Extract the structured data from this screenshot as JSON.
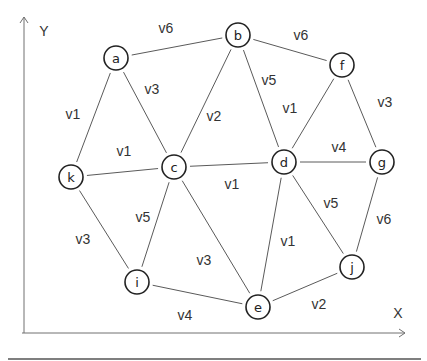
{
  "diagram": {
    "type": "weighted-undirected-graph",
    "axes": {
      "x_label": "X",
      "y_label": "Y"
    },
    "nodes": [
      {
        "id": "a",
        "label": "a",
        "x": 116,
        "y": 58
      },
      {
        "id": "b",
        "label": "b",
        "x": 238,
        "y": 35
      },
      {
        "id": "f",
        "label": "f",
        "x": 342,
        "y": 65
      },
      {
        "id": "k",
        "label": "k",
        "x": 71,
        "y": 177
      },
      {
        "id": "c",
        "label": "c",
        "x": 174,
        "y": 167
      },
      {
        "id": "d",
        "label": "d",
        "x": 284,
        "y": 162
      },
      {
        "id": "g",
        "label": "g",
        "x": 382,
        "y": 162
      },
      {
        "id": "i",
        "label": "i",
        "x": 137,
        "y": 282
      },
      {
        "id": "e",
        "label": "e",
        "x": 258,
        "y": 307
      },
      {
        "id": "j",
        "label": "j",
        "x": 352,
        "y": 267
      }
    ],
    "edges": [
      {
        "from": "a",
        "to": "b",
        "label": "v6",
        "lx": 166,
        "ly": 28
      },
      {
        "from": "b",
        "to": "f",
        "label": "v6",
        "lx": 301,
        "ly": 35
      },
      {
        "from": "a",
        "to": "k",
        "label": "v1",
        "lx": 73,
        "ly": 114
      },
      {
        "from": "a",
        "to": "c",
        "label": "v3",
        "lx": 152,
        "ly": 89
      },
      {
        "from": "b",
        "to": "c",
        "label": "v2",
        "lx": 214,
        "ly": 116
      },
      {
        "from": "b",
        "to": "d",
        "label": "v5",
        "lx": 269,
        "ly": 80
      },
      {
        "from": "f",
        "to": "d",
        "label": "v1",
        "lx": 290,
        "ly": 108
      },
      {
        "from": "f",
        "to": "g",
        "label": "v3",
        "lx": 385,
        "ly": 102
      },
      {
        "from": "k",
        "to": "c",
        "label": "v1",
        "lx": 124,
        "ly": 151
      },
      {
        "from": "c",
        "to": "d",
        "label": "v1",
        "lx": 232,
        "ly": 184
      },
      {
        "from": "d",
        "to": "g",
        "label": "v4",
        "lx": 339,
        "ly": 147
      },
      {
        "from": "k",
        "to": "i",
        "label": "v3",
        "lx": 83,
        "ly": 239
      },
      {
        "from": "c",
        "to": "i",
        "label": "v5",
        "lx": 143,
        "ly": 217
      },
      {
        "from": "c",
        "to": "e",
        "label": "v3",
        "lx": 204,
        "ly": 260
      },
      {
        "from": "d",
        "to": "e",
        "label": "v1",
        "lx": 288,
        "ly": 241
      },
      {
        "from": "d",
        "to": "j",
        "label": "v5",
        "lx": 331,
        "ly": 203
      },
      {
        "from": "g",
        "to": "j",
        "label": "v6",
        "lx": 384,
        "ly": 219
      },
      {
        "from": "i",
        "to": "e",
        "label": "v4",
        "lx": 185,
        "ly": 315
      },
      {
        "from": "e",
        "to": "j",
        "label": "v2",
        "lx": 319,
        "ly": 304
      }
    ]
  }
}
